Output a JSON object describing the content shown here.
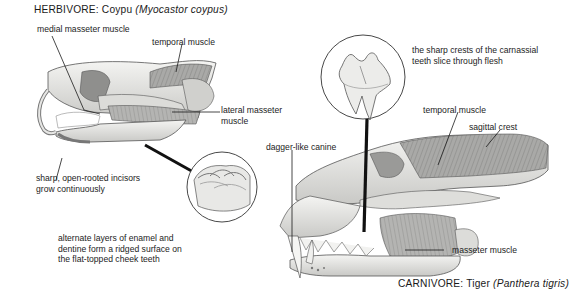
{
  "herbivore": {
    "title_prefix": "HERBIVORE: Coypu ",
    "title_species": "(Myocastor coypus)",
    "labels": {
      "medial_masseter": "medial masseter muscle",
      "temporal": "temporal muscle",
      "lateral_masseter_line1": "lateral masseter",
      "lateral_masseter_line2": "muscle",
      "incisors_line1": "sharp, open-rooted incisors",
      "incisors_line2": "grow continuously",
      "cheek_teeth_line1": "alternate layers of enamel and",
      "cheek_teeth_line2": "dentine form a ridged surface on",
      "cheek_teeth_line3": "the flat-topped cheek teeth"
    }
  },
  "carnivore": {
    "title_prefix": "CARNIVORE: Tiger ",
    "title_species": "(Panthera tigris)",
    "labels": {
      "carnassial_line1": "the sharp crests of the carnassial",
      "carnassial_line2": "teeth slice through flesh",
      "temporal": "temporal muscle",
      "sagittal_crest": "sagittal crest",
      "canine": "dagger-like canine",
      "masseter": "masseter muscle"
    }
  },
  "colors": {
    "bone": "#e9e9e7",
    "bone_shadow": "#b9b9b6",
    "muscle": "#9a9a98",
    "outline": "#4a4a4a",
    "leader": "#111111"
  }
}
